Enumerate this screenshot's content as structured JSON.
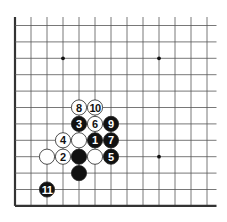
{
  "diagram": {
    "type": "go-board-fragment",
    "corner": "bottom-left",
    "grid": {
      "cols": 13,
      "rows": 12,
      "origin_x": 15,
      "origin_y": 25.5,
      "spacing_x": 16,
      "spacing_y": 16.4,
      "top_extend": 8.5,
      "right_extend": 9.5,
      "edges": [
        "left",
        "bottom"
      ]
    },
    "colors": {
      "line": "#555555",
      "edge": "#333333",
      "black_stone": "#111111",
      "white_stone": "#ffffff",
      "star": "#111111"
    },
    "star_points": [
      {
        "col": 3,
        "row": 2
      },
      {
        "col": 9,
        "row": 2
      },
      {
        "col": 9,
        "row": 8
      }
    ],
    "stones": [
      {
        "col": 5,
        "row": 7,
        "color": "black",
        "label": "1"
      },
      {
        "col": 3,
        "row": 8,
        "color": "white",
        "label": "2"
      },
      {
        "col": 4,
        "row": 6,
        "color": "black",
        "label": "3"
      },
      {
        "col": 3,
        "row": 7,
        "color": "white",
        "label": "4"
      },
      {
        "col": 6,
        "row": 8,
        "color": "black",
        "label": "5"
      },
      {
        "col": 5,
        "row": 6,
        "color": "white",
        "label": "6"
      },
      {
        "col": 6,
        "row": 7,
        "color": "black",
        "label": "7"
      },
      {
        "col": 4,
        "row": 5,
        "color": "white",
        "label": "8"
      },
      {
        "col": 6,
        "row": 6,
        "color": "black",
        "label": "9"
      },
      {
        "col": 5,
        "row": 5,
        "color": "white",
        "label": "10"
      },
      {
        "col": 2,
        "row": 10,
        "color": "black",
        "label": "11"
      },
      {
        "col": 4,
        "row": 7,
        "color": "white",
        "label": ""
      },
      {
        "col": 2,
        "row": 8,
        "color": "white",
        "label": ""
      },
      {
        "col": 4,
        "row": 8,
        "color": "black",
        "label": ""
      },
      {
        "col": 5,
        "row": 8,
        "color": "white",
        "label": ""
      },
      {
        "col": 4,
        "row": 9,
        "color": "black",
        "label": ""
      }
    ]
  }
}
